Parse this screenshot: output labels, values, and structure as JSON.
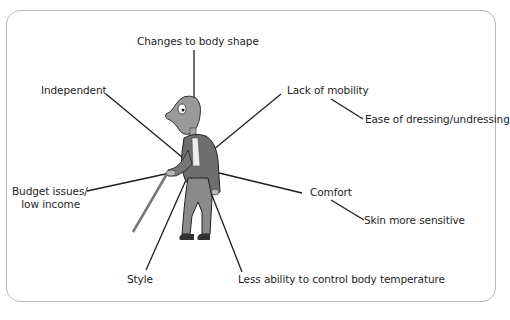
{
  "figure": {
    "labels": {
      "changes_body_shape": "Changes to body shape",
      "independent": "Independent",
      "lack_mobility": "Lack of mobility",
      "ease_dressing": "Ease of dressing/undressing",
      "budget_line1": "Budget issues/",
      "budget_line2": "low income",
      "comfort": "Comfort",
      "skin_sensitive": "Skin more sensitive",
      "style": "Style",
      "less_ability_temp": "Less ability to control body temperature"
    },
    "colors": {
      "frame_border": "#b9b9b9",
      "line": "#1e1e1e",
      "text": "#1e1e1e"
    }
  }
}
